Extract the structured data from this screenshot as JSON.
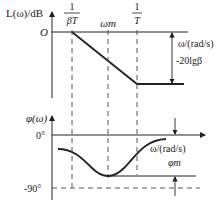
{
  "magnitude_plot": {
    "y_label": "L(ω)/dB",
    "origin_label": "O",
    "x_label": "ω/(rad/s)",
    "corner1_num": "1",
    "corner1_den": "βT",
    "center_label": "ωm",
    "corner2_num": "1",
    "corner2_den": "T",
    "gain_label": "-20lgβ"
  },
  "phase_plot": {
    "y_label": "φ(ω)",
    "zero_label": "0°",
    "minus90_label": "-90°",
    "x_label": "ω/(rad/s)",
    "phase_max_label": "φm"
  },
  "colors": {
    "line": "#222222",
    "dash": "#444444"
  }
}
